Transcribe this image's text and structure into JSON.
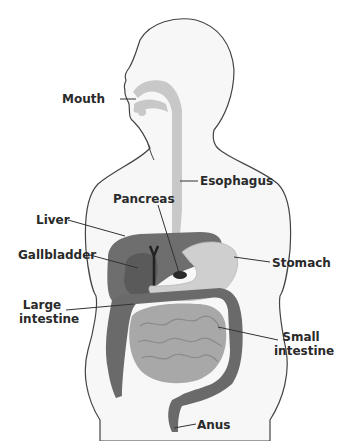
{
  "diagram": {
    "colors": {
      "body_fill": "#f7f7f7",
      "outline": "#444444",
      "tract_light": "#c8c8c8",
      "liver": "#6e6e6e",
      "gallbladder": "#5a5a5a",
      "stomach": "#cfcfcf",
      "large_intestine": "#6a6a6a",
      "small_intestine": "#a8a8a8",
      "label_text": "#2a2a2a"
    },
    "labels": {
      "mouth": "Mouth",
      "esophagus": "Esophagus",
      "pancreas": "Pancreas",
      "liver": "Liver",
      "gallbladder": "Gallbladder",
      "stomach": "Stomach",
      "large_intestine_1": "Large",
      "large_intestine_2": "intestine",
      "small_intestine_1": "Small",
      "small_intestine_2": "intestine",
      "anus": "Anus"
    }
  }
}
